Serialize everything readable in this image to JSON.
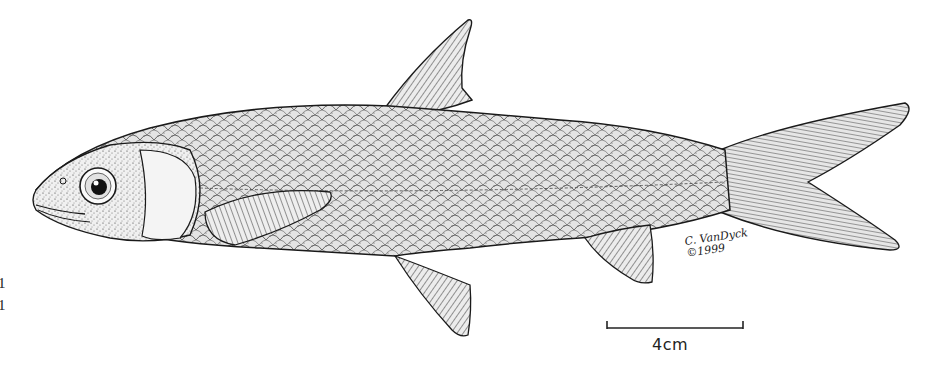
{
  "figure": {
    "edge_labels": [
      "1",
      "1"
    ],
    "scale_bar": {
      "label": "4cm",
      "x_start": 607,
      "x_end": 743,
      "y": 328
    },
    "signature": {
      "line1": "C. VanDyck",
      "line2": "©1999"
    },
    "colors": {
      "ink": "#1a1a1a",
      "paper": "#ffffff",
      "body_shade": "#d9d9d9",
      "head_shade": "#ececec",
      "fin_shade": "#cfcfcf"
    },
    "parts": [
      {
        "name": "head",
        "description": "Stippled head with large eye and operculum"
      },
      {
        "name": "body",
        "description": "Elongate body with cross-hatched scales"
      },
      {
        "name": "dorsal-fin",
        "description": "Rayed dorsal fin, apex near (470,18)"
      },
      {
        "name": "pectoral-fin",
        "description": "Rayed pectoral fin behind operculum"
      },
      {
        "name": "pelvic-fin",
        "description": "Rayed pelvic fin below mid-body"
      },
      {
        "name": "anal-fin",
        "description": "Rayed anal fin near tail"
      },
      {
        "name": "caudal-fin",
        "description": "Deeply forked rayed tail fin"
      }
    ]
  }
}
